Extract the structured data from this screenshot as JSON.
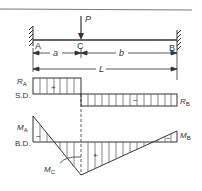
{
  "figure": {
    "type": "fixed-fixed beam with point load",
    "beam": {
      "left_support": "A",
      "right_support": "B",
      "load_point": "C",
      "load_label": "P"
    },
    "dimensions": {
      "a": "a",
      "b": "b",
      "total": "L"
    },
    "shear_diagram": {
      "label": "S.D.",
      "left_value": "R",
      "left_sub": "A",
      "right_value": "R",
      "right_sub": "B",
      "positive_sign": "+",
      "negative_sign": "−"
    },
    "moment_diagram": {
      "label": "B.D.",
      "left_moment": "M",
      "left_sub": "A",
      "right_moment": "M",
      "right_sub": "B",
      "center_moment": "M",
      "center_sub": "C",
      "left_sign": "−",
      "middle_sign": "+",
      "right_sign": "−"
    }
  },
  "colors": {
    "line": "#333333",
    "hatch": "#555555",
    "background": "#ffffff"
  }
}
